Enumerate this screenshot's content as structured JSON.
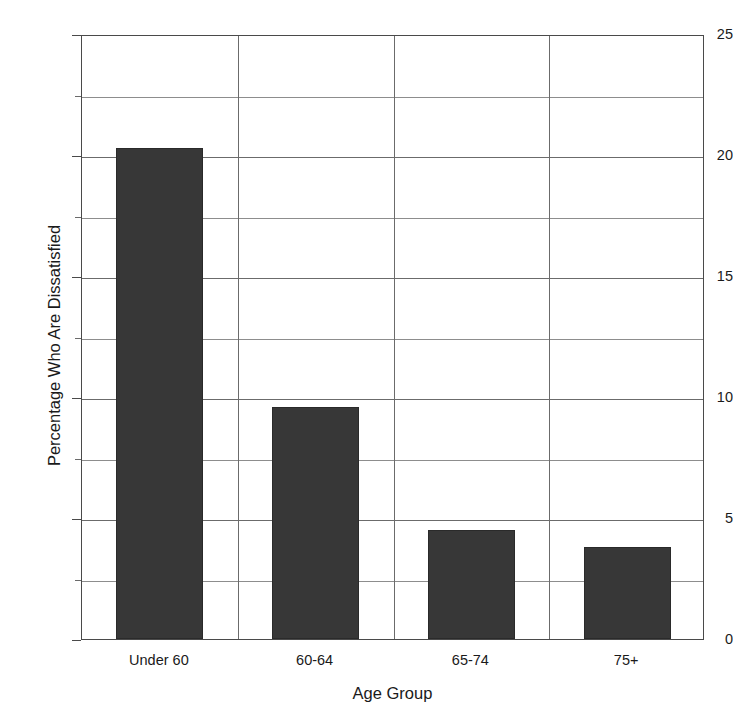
{
  "chart_data": {
    "type": "bar",
    "title": "",
    "categories": [
      "Under 60",
      "60-64",
      "65-74",
      "75+"
    ],
    "values": [
      20.3,
      9.6,
      4.5,
      3.8
    ],
    "xlabel": "Age Group",
    "ylabel": "Percentage Who Are Dissatisfied",
    "ylim": [
      0,
      25
    ],
    "ytick_labels": [
      "0",
      "5",
      "10",
      "15",
      "20",
      "25"
    ],
    "ytick_values": [
      0,
      5,
      10,
      15,
      20,
      25
    ],
    "yminor_values": [
      2.5,
      7.5,
      12.5,
      17.5,
      22.5
    ],
    "grid": "horizontal-major-and-minor + vertical category separators",
    "legend": "none",
    "bar_color": "#373737",
    "bar_edge_color": "#2a2a2a",
    "grid_color": "#6b6b6b",
    "axis_color": "#4a4a4a",
    "background": "#ffffff"
  },
  "axes": {
    "y_title": "Percentage Who Are Dissatisfied",
    "x_title": "Age Group"
  },
  "title_bar": {
    "clipped_title": ""
  }
}
